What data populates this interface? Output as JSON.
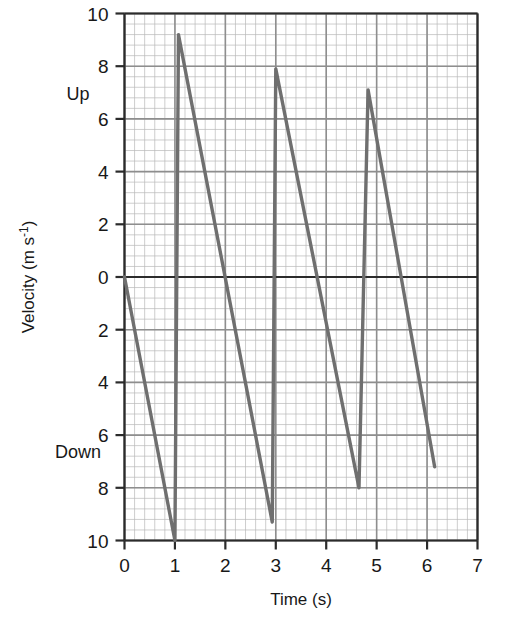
{
  "chart_data": {
    "type": "line",
    "title": "",
    "xlabel": "Time (s)",
    "ylabel": "Velocity (m s⁻¹)",
    "ylabel_main": "Velocity (m s",
    "ylabel_sup": "-1",
    "ylabel_tail": ")",
    "xlim": [
      0,
      7
    ],
    "ylim": [
      -10,
      10
    ],
    "grid": true,
    "grid_style": "graph-paper",
    "grid_minor_step_x": 0.2,
    "grid_minor_step_y": 0.4,
    "grid_major_step_x": 1,
    "grid_major_step_y": 2,
    "legend": "none",
    "xticks": [
      0,
      1,
      2,
      3,
      4,
      5,
      6,
      7
    ],
    "xtick_labels": [
      "0",
      "1",
      "2",
      "3",
      "4",
      "5",
      "6",
      "7"
    ],
    "yticks": [
      10,
      8,
      6,
      4,
      2,
      0,
      -2,
      -4,
      -6,
      -8,
      -10
    ],
    "ytick_labels": [
      "10",
      "8",
      "6",
      "4",
      "2",
      "0",
      "2",
      "4",
      "6",
      "8",
      "10"
    ],
    "direction_labels": [
      {
        "text": "Up",
        "value": 7
      },
      {
        "text": "Down",
        "value": -6.6
      }
    ],
    "line_color": "#6f6f6f",
    "axis_color": "#2b2b2b",
    "grid_minor_color": "#b9b9b9",
    "grid_major_color": "#8e8e8e",
    "series": [
      {
        "name": "Bouncing ball velocity",
        "points": [
          [
            0.0,
            0.0
          ],
          [
            1.0,
            -10.0
          ],
          [
            1.07,
            9.2
          ],
          [
            2.93,
            -9.3
          ],
          [
            3.0,
            7.9
          ],
          [
            4.65,
            -8.0
          ],
          [
            4.83,
            7.1
          ],
          [
            6.15,
            -7.2
          ]
        ]
      }
    ],
    "annotations": []
  }
}
